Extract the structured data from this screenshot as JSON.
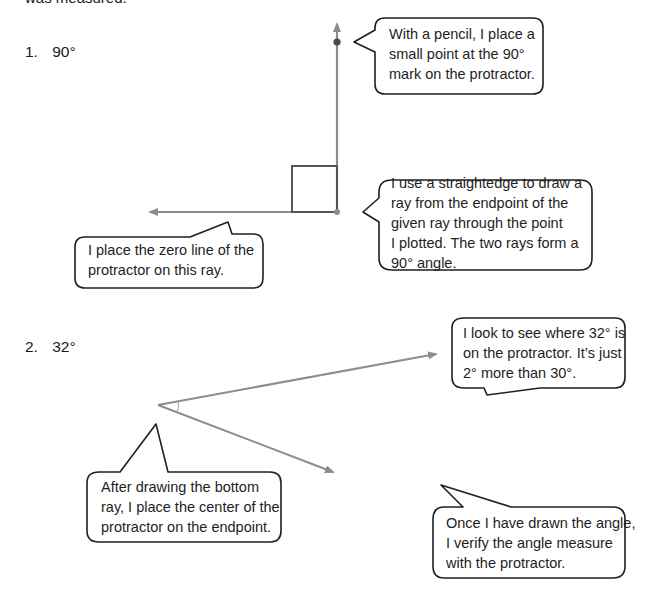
{
  "header": {
    "cutoff_text": "was measured."
  },
  "problems": [
    {
      "number": "1.",
      "angle": "90°",
      "callouts": [
        {
          "id": "pencil",
          "lines": [
            "With a pencil, I place a",
            "small point at the 90°",
            "mark on the protractor."
          ]
        },
        {
          "id": "straightedge",
          "lines": [
            "I use a straightedge to draw a",
            "ray from the endpoint of the",
            "given ray through the point",
            "I plotted.  The two rays form a",
            "90° angle."
          ]
        },
        {
          "id": "zero-line",
          "lines": [
            "I place the zero line of the",
            "protractor on this ray."
          ]
        }
      ]
    },
    {
      "number": "2.",
      "angle": "32°",
      "callouts": [
        {
          "id": "look",
          "lines": [
            "I look to see where 32° is",
            "on the protractor.  It’s just",
            "2° more than 30°."
          ]
        },
        {
          "id": "after-drawing",
          "lines": [
            "After drawing the bottom",
            "ray, I place the center of the",
            "protractor on the endpoint."
          ]
        },
        {
          "id": "verify",
          "lines": [
            "Once I have drawn the angle,",
            "I verify the angle measure",
            "with the protractor."
          ]
        }
      ]
    }
  ],
  "colors": {
    "ray": "#8c8c8c",
    "outline": "#1f1f1f",
    "square": "#555555"
  }
}
